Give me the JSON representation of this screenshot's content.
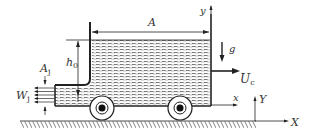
{
  "diagram": {
    "labels": {
      "tank_area": "A",
      "height": "h",
      "height_sub": "0",
      "jet_area": "A",
      "jet_area_sub": "j",
      "jet_velocity": "W",
      "jet_velocity_sub": "j",
      "gravity": "g",
      "cart_velocity": "U",
      "cart_velocity_sub": "c",
      "local_x": "x",
      "local_y": "y",
      "global_X": "X",
      "global_Y": "Y"
    },
    "colors": {
      "stroke": "#222222",
      "water_hatch": "#555555",
      "ground_hatch": "#666666",
      "background": "#ffffff"
    }
  }
}
